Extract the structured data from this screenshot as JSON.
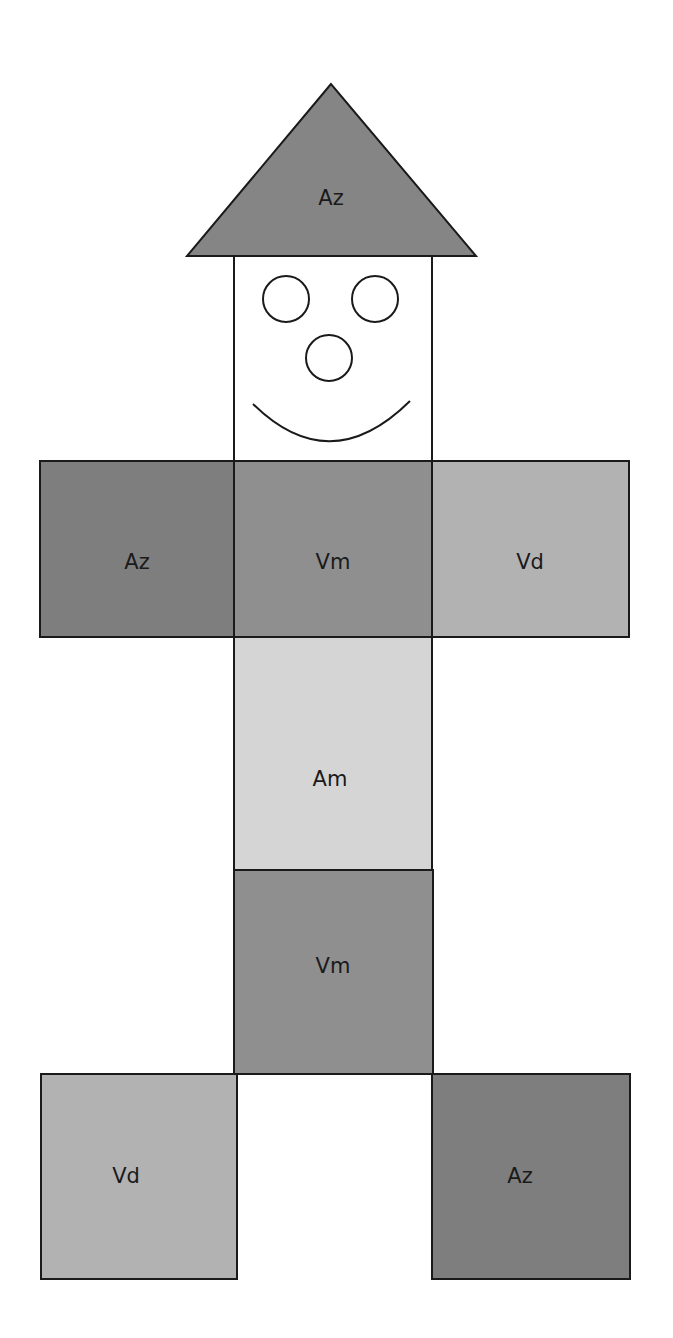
{
  "figure": {
    "hat": {
      "label": "Az",
      "color": "#858585"
    },
    "face": {
      "color": "#ffffff"
    },
    "body": {
      "left_arm": {
        "label": "Az",
        "color": "#7e7e7e"
      },
      "torso": {
        "label": "Vm",
        "color": "#8f8f8f"
      },
      "right_arm": {
        "label": "Vd",
        "color": "#b2b2b2"
      },
      "belly": {
        "label": "Am",
        "color": "#d5d5d5"
      },
      "hips": {
        "label": "Vm",
        "color": "#8f8f8f"
      },
      "left_foot": {
        "label": "Vd",
        "color": "#b2b2b2"
      },
      "right_foot": {
        "label": "Az",
        "color": "#7e7e7e"
      }
    }
  }
}
